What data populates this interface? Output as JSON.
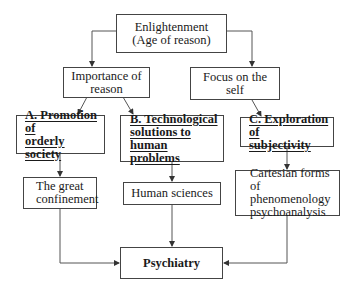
{
  "diagram": {
    "nodes": {
      "enlightenment": {
        "label": "Enlightenment\n(Age of reason)"
      },
      "reason": {
        "label": "Importance of\nreason"
      },
      "self": {
        "label": "Focus on the\nself"
      },
      "a": {
        "label": "A. Promotion of\norderly society"
      },
      "b": {
        "label": "B. Technological\nsolutions to human\nproblems"
      },
      "c": {
        "label": "C. Exploration of\nsubjectivity"
      },
      "confinement": {
        "label": "The great\nconfinement"
      },
      "human_sciences": {
        "label": "Human sciences"
      },
      "cartesian": {
        "label": "Cartesian forms of\nphenomenology\npsychoanalysis"
      },
      "psychiatry": {
        "label": "Psychiatry"
      }
    },
    "edges": [
      [
        "enlightenment",
        "reason"
      ],
      [
        "enlightenment",
        "self"
      ],
      [
        "reason",
        "a"
      ],
      [
        "reason",
        "b"
      ],
      [
        "self",
        "c"
      ],
      [
        "a",
        "confinement"
      ],
      [
        "b",
        "human_sciences"
      ],
      [
        "c",
        "cartesian"
      ],
      [
        "confinement",
        "psychiatry"
      ],
      [
        "human_sciences",
        "psychiatry"
      ],
      [
        "cartesian",
        "psychiatry"
      ]
    ],
    "colors": {
      "line": "#444444",
      "text": "#1a1a1a",
      "background": "#ffffff"
    }
  }
}
